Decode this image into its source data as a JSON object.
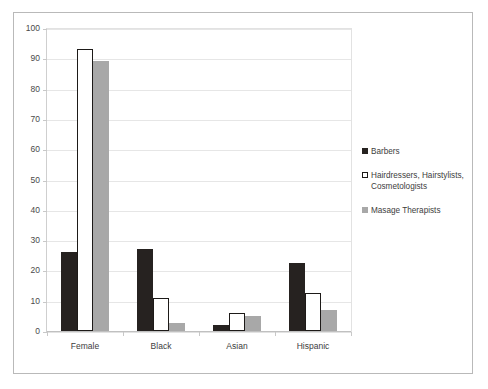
{
  "chart_data": {
    "type": "bar",
    "title": "",
    "xlabel": "",
    "ylabel": "",
    "ylim": [
      0,
      100
    ],
    "ytick_step": 10,
    "yticks": [
      "100",
      "90",
      "80",
      "70",
      "60",
      "50",
      "40",
      "30",
      "20",
      "10",
      "0"
    ],
    "grid": true,
    "legend_position": "right",
    "categories": [
      "Female",
      "Black",
      "Asian",
      "Hispanic"
    ],
    "series": [
      {
        "name": "Barbers",
        "color": "#262220",
        "swatch": "filled-dark-square",
        "values": [
          26,
          27,
          2,
          22.5
        ]
      },
      {
        "name": "Hairdressers, Hairstylists, Cosmetologists",
        "color": "#ffffff",
        "swatch": "open-square-black-outline",
        "values": [
          93,
          11,
          6,
          12.5
        ]
      },
      {
        "name": "Masage Therapists",
        "color": "#a8a8a8",
        "swatch": "filled-gray-square",
        "values": [
          89,
          2.5,
          5,
          7
        ]
      }
    ]
  }
}
